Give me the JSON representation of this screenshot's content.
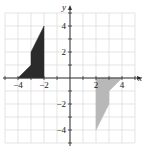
{
  "diagram": {
    "type": "coordinate-plane",
    "axes": {
      "x_label": "x",
      "y_label": "y",
      "x_range": [
        -5,
        5
      ],
      "y_range": [
        -5,
        5
      ],
      "x_tick_labels": [
        {
          "value": -4,
          "text": "−4"
        },
        {
          "value": -2,
          "text": "−2"
        },
        {
          "value": 2,
          "text": "2"
        },
        {
          "value": 4,
          "text": "4"
        }
      ],
      "y_tick_labels": [
        {
          "value": 4,
          "text": "4"
        },
        {
          "value": 2,
          "text": "2"
        },
        {
          "value": -2,
          "text": "−2"
        },
        {
          "value": -4,
          "text": "−4"
        }
      ],
      "grid": true
    },
    "shapes": [
      {
        "name": "dark-figure",
        "fill": "#2b2b2b",
        "vertices": [
          [
            -4,
            0
          ],
          [
            -3,
            1
          ],
          [
            -3,
            2
          ],
          [
            -2,
            4
          ],
          [
            -2,
            0
          ]
        ]
      },
      {
        "name": "light-figure",
        "fill": "#b8b8b8",
        "vertices": [
          [
            2,
            0
          ],
          [
            4,
            0
          ],
          [
            3,
            -1
          ],
          [
            3,
            -2
          ],
          [
            2,
            -4
          ]
        ]
      }
    ],
    "colors": {
      "grid": "#d9d9d9",
      "axis": "#333333"
    }
  }
}
